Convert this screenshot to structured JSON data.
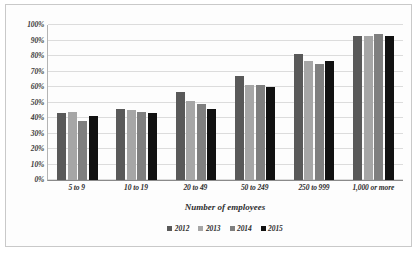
{
  "chart_data": {
    "type": "bar",
    "title": "",
    "xlabel": "Number of employees",
    "ylabel": "",
    "ylim": [
      0,
      100
    ],
    "yticks": [
      "0%",
      "10%",
      "20%",
      "30%",
      "40%",
      "50%",
      "60%",
      "70%",
      "80%",
      "90%",
      "100%"
    ],
    "ytick_values": [
      0,
      10,
      20,
      30,
      40,
      50,
      60,
      70,
      80,
      90,
      100
    ],
    "grid": true,
    "legend_position": "bottom",
    "categories": [
      "5 to 9",
      "10 to 19",
      "20 to 49",
      "50 to 249",
      "250 to 999",
      "1,000 or more"
    ],
    "series": [
      {
        "name": "2012",
        "color": "#595959",
        "values": [
          43,
          46,
          57,
          67,
          81,
          93
        ]
      },
      {
        "name": "2013",
        "color": "#a6a6a6",
        "values": [
          44,
          45,
          51,
          61,
          77,
          93
        ]
      },
      {
        "name": "2014",
        "color": "#7f7f7f",
        "values": [
          38,
          44,
          49,
          61,
          75,
          94
        ]
      },
      {
        "name": "2015",
        "color": "#111111",
        "values": [
          41,
          43,
          46,
          60,
          77,
          93
        ]
      }
    ]
  }
}
